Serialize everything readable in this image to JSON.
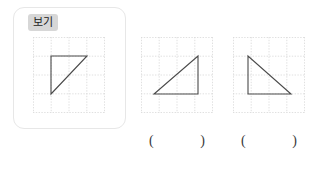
{
  "page": {
    "width": 323,
    "height": 169,
    "background": "#ffffff"
  },
  "example_card": {
    "badge_label": "보기",
    "badge_background": "#d7d7d7",
    "border_color": "#e7e7e7"
  },
  "figures": [
    {
      "id": "example",
      "name": "example-triangle",
      "grid": {
        "cols": 4,
        "rows": 4,
        "line_color": "#d8d8d8",
        "style": "dotted"
      },
      "shape": "right-triangle",
      "description": "Right triangle with vertical left leg, horizontal top leg, hypotenuse from bottom-left to top-right",
      "stroke_color": "#4a4a4a",
      "points": "18,9 63,9 18,63",
      "vertices": [
        {
          "x": 18,
          "y": 9
        },
        {
          "x": 63,
          "y": 9
        },
        {
          "x": 18,
          "y": 63
        }
      ]
    },
    {
      "id": "option-a",
      "name": "option-a-triangle",
      "grid": {
        "cols": 4,
        "rows": 4,
        "line_color": "#d8d8d8",
        "style": "dotted"
      },
      "shape": "right-triangle",
      "description": "Right triangle with horizontal bottom leg, vertical right leg, hypotenuse from bottom-left to top-right",
      "stroke_color": "#4a4a4a",
      "points": "13,63 58,63 58,17",
      "vertices": [
        {
          "x": 13,
          "y": 63
        },
        {
          "x": 58,
          "y": 63
        },
        {
          "x": 58,
          "y": 17
        }
      ]
    },
    {
      "id": "option-b",
      "name": "option-b-triangle",
      "grid": {
        "cols": 4,
        "rows": 4,
        "line_color": "#d8d8d8",
        "style": "dotted"
      },
      "shape": "right-triangle",
      "description": "Right triangle with vertical left leg, horizontal bottom leg, hypotenuse from top-left to bottom-right",
      "stroke_color": "#4a4a4a",
      "points": "14,17 14,63 59,63",
      "vertices": [
        {
          "x": 14,
          "y": 17
        },
        {
          "x": 14,
          "y": 63
        },
        {
          "x": 59,
          "y": 63
        }
      ]
    }
  ],
  "answers": [
    {
      "id": "answer-a",
      "open": "(",
      "value": "",
      "close": ")"
    },
    {
      "id": "answer-b",
      "open": "(",
      "value": "",
      "close": ")"
    }
  ]
}
